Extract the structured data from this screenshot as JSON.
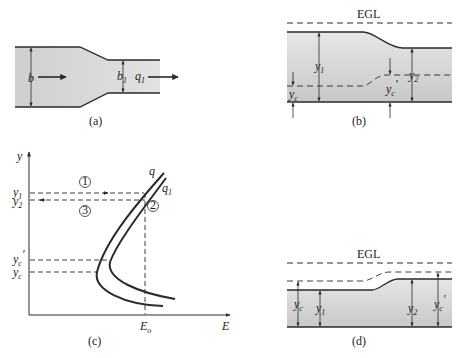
{
  "panels": {
    "a": {
      "caption": "(a)",
      "labels": {
        "width_in": "b",
        "width_out": "b",
        "width_out_sub": "1",
        "flow_out": "q",
        "flow_out_sub": "1"
      }
    },
    "b": {
      "caption": "(b)",
      "labels": {
        "egl": "EGL",
        "y1": "y",
        "y1_sub": "1",
        "y2": "y",
        "y2_sub": "2",
        "yc": "y",
        "yc_sub": "c",
        "ycp": "y",
        "ycp_sub": "c",
        "ycp_prime": "′"
      }
    },
    "c": {
      "caption": "(c)",
      "axes": {
        "x": "E",
        "y": "y"
      },
      "ticks": {
        "y1": "y",
        "y1_sub": "1",
        "y2": "y",
        "y2_sub": "2",
        "ycp": "y",
        "ycp_sub": "c",
        "ycp_prime": "′",
        "yc": "y",
        "yc_sub": "c",
        "Eo": "E",
        "Eo_sub": "o"
      },
      "curves": {
        "q": "q",
        "q1": "q",
        "q1_sub": "1"
      },
      "markers": {
        "m1": "1",
        "m2": "2",
        "m3": "3"
      }
    },
    "d": {
      "caption": "(d)",
      "labels": {
        "egl": "EGL",
        "yc": "y",
        "yc_sub": "c",
        "y1": "y",
        "y1_sub": "1",
        "y2": "y",
        "y2_sub": "2",
        "ycp": "y",
        "ycp_sub": "c",
        "ycp_prime": "′"
      }
    }
  },
  "colors": {
    "water_top": "#d9d9d9",
    "water_bottom": "#c4c4c4",
    "line": "#2a2a2a"
  }
}
